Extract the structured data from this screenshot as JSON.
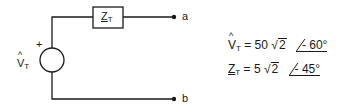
{
  "diagram": {
    "source": {
      "label_main": "V",
      "label_sub": "T",
      "hat": true,
      "polarity": "+"
    },
    "impedance": {
      "label_main": "Z",
      "label_sub": "T",
      "underlined": true
    },
    "terminals": [
      {
        "label": "a"
      },
      {
        "label": "b"
      }
    ],
    "colors": {
      "line": "#1a1a1a",
      "background": "#ffffff"
    }
  },
  "equations": [
    {
      "lhs_main": "V",
      "lhs_sub": "T",
      "lhs_style": "hat",
      "eq": "=",
      "magnitude": "50",
      "radicand": "2",
      "angle": "- 60°"
    },
    {
      "lhs_main": "Z",
      "lhs_sub": "T",
      "lhs_style": "underline",
      "eq": "=",
      "magnitude": "5",
      "radicand": "2",
      "angle": "- 45°"
    }
  ]
}
